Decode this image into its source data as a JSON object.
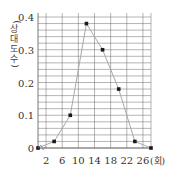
{
  "chart_data": {
    "type": "line",
    "title": "",
    "xlabel": "(회)",
    "ylabel": "(상대도수)",
    "x": [
      0,
      4,
      8,
      12,
      16,
      20,
      24,
      28
    ],
    "series": [
      {
        "name": "상대도수",
        "values": [
          0,
          0.02,
          0.1,
          0.38,
          0.3,
          0.18,
          0.02,
          0
        ]
      }
    ],
    "x_tick_labels": [
      "2",
      "6",
      "10",
      "14",
      "18",
      "22",
      "26"
    ],
    "y_tick_labels": [
      "0",
      "0.1",
      "0.2",
      "0.3",
      "0.4"
    ],
    "ylim": [
      0,
      0.4
    ],
    "xlim": [
      0,
      28
    ],
    "grid": true,
    "y_grid_step": 0.02,
    "legend": "none"
  },
  "labels": {
    "y_axis_title": "(상대도수)",
    "x_axis_unit": "(회)",
    "origin": "0",
    "y_ticks": [
      "0.4",
      "0.3",
      "0.2",
      "0.1"
    ],
    "x_ticks": [
      "2",
      "6",
      "10",
      "14",
      "18",
      "22",
      "26"
    ]
  },
  "colors": {
    "grid": "#6b6b6b",
    "line": "#a8a8a8",
    "point": "#1a1a1a"
  }
}
